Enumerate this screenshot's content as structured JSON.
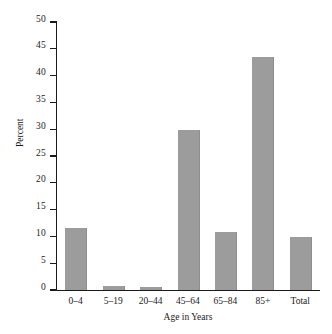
{
  "chart_data": {
    "type": "bar",
    "title": "",
    "subtitle": "",
    "xlabel": "Age in Years",
    "ylabel": "Percent",
    "categories": [
      "0–4",
      "5–19",
      "20–44",
      "45–64",
      "65–84",
      "85+",
      "Total"
    ],
    "values": [
      11.5,
      0.8,
      0.5,
      29.8,
      10.9,
      43.5,
      9.8
    ],
    "ylim": [
      0,
      50
    ],
    "yticks": [
      0,
      5,
      10,
      15,
      20,
      25,
      30,
      35,
      40,
      45,
      50
    ],
    "ytick_labels": [
      "0",
      "5",
      "10",
      "15",
      "20",
      "25",
      "30",
      "35",
      "40",
      "45",
      "50"
    ],
    "grid": false,
    "legend": null,
    "bar_color": "#9c9c9c",
    "axis_color": "#1a1a1a",
    "background_color": "#ffffff"
  }
}
